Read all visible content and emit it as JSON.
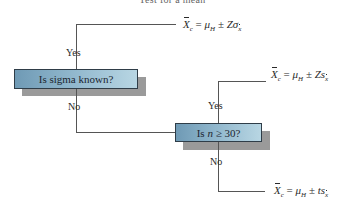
{
  "title": "Test for a mean",
  "colors": {
    "box_gradient_start": "#6f9ab5",
    "box_gradient_end": "#b8d6e3",
    "box_border": "#2f3d48",
    "shadow": "#9a9a9a",
    "line": "#555555"
  },
  "decision1": {
    "question": "Is sigma known?",
    "yes_label": "Yes",
    "no_label": "No"
  },
  "decision2": {
    "question_prefix": "Is ",
    "question_var": "n",
    "question_suffix": " ≥ 30?",
    "yes_label": "Yes",
    "no_label": "No"
  },
  "outcomes": {
    "sigma_known": {
      "lhs_var": "X",
      "lhs_sub": "c",
      "equals": " = ",
      "mu": "μ",
      "mu_sub": "H",
      "pm": " ± ",
      "stat": "Zσ",
      "stat_sub": "x",
      "text": "X̄c = μH ± Zσx̄"
    },
    "large_sample": {
      "lhs_var": "X",
      "lhs_sub": "c",
      "equals": " = ",
      "mu": "μ",
      "mu_sub": "H",
      "pm": " ± ",
      "stat": "Zs",
      "stat_sub": "x",
      "text": "X̄c = μH ± Zsx̄"
    },
    "small_sample": {
      "lhs_var": "X",
      "lhs_sub": "c",
      "equals": " = ",
      "mu": "μ",
      "mu_sub": "H",
      "pm": " ± ",
      "stat": "ts",
      "stat_sub": "x",
      "text": "X̄c = μH ± tsx̄"
    }
  }
}
